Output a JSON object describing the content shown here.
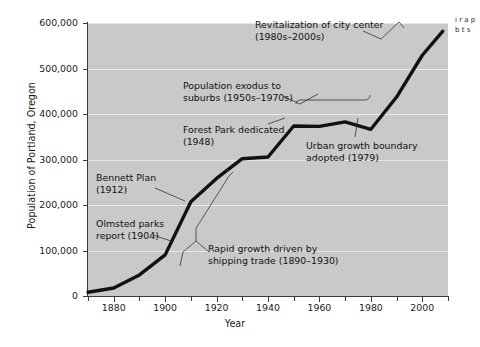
{
  "chart_data": {
    "type": "line",
    "title": "",
    "xlabel": "Year",
    "ylabel": "Population of Portland, Oregon",
    "xlim": [
      1870,
      2010
    ],
    "ylim": [
      0,
      600000
    ],
    "grid": true,
    "legend": "none",
    "x_ticks": [
      1880,
      1900,
      1920,
      1940,
      1960,
      1980,
      2000
    ],
    "x_minor_step": 10,
    "y_ticks": [
      0,
      100000,
      200000,
      300000,
      400000,
      500000,
      600000
    ],
    "y_tick_labels": [
      "0",
      "100,000",
      "200,000",
      "300,000",
      "400,000",
      "500,000",
      "600,000"
    ],
    "series": [
      {
        "name": "Population of Portland, Oregon",
        "x": [
          1870,
          1880,
          1890,
          1900,
          1910,
          1920,
          1930,
          1940,
          1950,
          1960,
          1970,
          1980,
          1990,
          2000,
          2008
        ],
        "values": [
          8300,
          17600,
          46400,
          90400,
          207200,
          258300,
          301800,
          305400,
          373600,
          372700,
          382600,
          366400,
          437300,
          529100,
          582000
        ]
      }
    ],
    "annotations": [
      {
        "id": "revitalization",
        "text": "Revitalization of city center\n(1980s–2000s)",
        "points_to_year": 1993
      },
      {
        "id": "population-exodus",
        "text": "Population exodus to\nsuburbs (1950s–1970s)",
        "points_to_year": 1963
      },
      {
        "id": "forest-park",
        "text": "Forest Park dedicated\n(1948)",
        "points_to_year": 1948
      },
      {
        "id": "urban-growth-boundary",
        "text": "Urban growth boundary\nadopted (1979)",
        "points_to_year": 1979
      },
      {
        "id": "bennett-plan",
        "text": "Bennett Plan\n(1912)",
        "points_to_year": 1912
      },
      {
        "id": "olmsted-parks",
        "text": "Olmsted parks\nreport (1904)",
        "points_to_year": 1904
      },
      {
        "id": "rapid-growth",
        "text": "Rapid growth driven by\nshipping trade (1890–1930)",
        "points_to_year": 1910
      }
    ]
  },
  "axes": {
    "y_title": "Population of Portland, Oregon",
    "x_title": "Year",
    "y_labels": [
      "600,000",
      "500,000",
      "400,000",
      "300,000",
      "200,000",
      "100,000",
      "0"
    ],
    "x_labels": [
      "1880",
      "1900",
      "1920",
      "1940",
      "1960",
      "1980",
      "2000"
    ]
  },
  "annotations": {
    "revitalization": "Revitalization of city center\n(1980s–2000s)",
    "population_exodus": "Population exodus to\nsuburbs (1950s–1970s)",
    "forest_park": "Forest Park dedicated\n(1948)",
    "urban_growth": "Urban growth boundary\nadopted (1979)",
    "bennett_plan": "Bennett Plan\n(1912)",
    "olmsted_parks": "Olmsted parks\nreport (1904)",
    "rapid_growth": "Rapid growth driven by\nshipping trade (1890–1930)"
  },
  "side_caption": {
    "text": "i\nr\na\np\nb\nt\ns"
  },
  "colors": {
    "plot_background": "#c9c9c9",
    "grid": "#e8e8e8",
    "line": "#111111",
    "axis": "#3a3a3a",
    "text": "#1a1a1a",
    "page_background": "#ffffff"
  }
}
